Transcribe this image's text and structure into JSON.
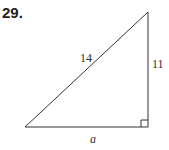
{
  "problem_number": "29.",
  "diagram": {
    "type": "right-triangle",
    "hypotenuse_label": "14",
    "vertical_leg_label": "11",
    "horizontal_leg_label": "a",
    "right_angle_marker": true,
    "stroke_color": "#333333"
  }
}
